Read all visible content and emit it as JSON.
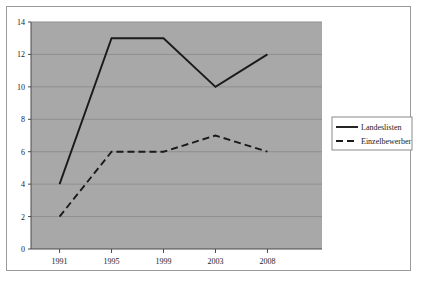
{
  "chart_data": {
    "type": "line",
    "title": "",
    "subtitle": "",
    "xlabel": "",
    "ylabel": "",
    "categories": [
      "1991",
      "1995",
      "1999",
      "2003",
      "2008"
    ],
    "series": [
      {
        "name": "Landeslisten",
        "values": [
          4,
          13,
          13,
          10,
          12
        ],
        "style": "solid",
        "color": "#1a1a1a"
      },
      {
        "name": "Einzelbewerber",
        "values": [
          2,
          6,
          6,
          7,
          6
        ],
        "style": "dashed",
        "color": "#1a1a1a"
      }
    ],
    "ylim": [
      0,
      14
    ],
    "yticks": [
      "0",
      "2",
      "4",
      "6",
      "8",
      "10",
      "12",
      "14"
    ],
    "ytick_values": [
      0,
      2,
      4,
      6,
      8,
      10,
      12,
      14
    ],
    "xticks": [
      "1991",
      "1995",
      "1999",
      "2003",
      "2008"
    ],
    "grid": true,
    "grid_axis": "y",
    "legend_position": "right",
    "plot_background": "#a8a8a8",
    "grid_color": "#8f8f8f",
    "figure_background": "#ffffff",
    "frame_color": "#9a9a9a"
  },
  "legend": {
    "entries": [
      {
        "label": "Landeslisten",
        "style": "solid"
      },
      {
        "label": "Einzelbewerber",
        "style": "dashed"
      }
    ]
  }
}
